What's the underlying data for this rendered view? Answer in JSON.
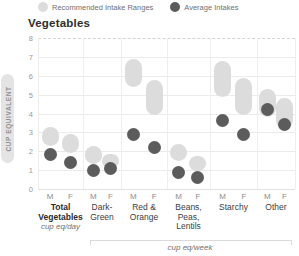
{
  "chart_data": {
    "type": "scatter",
    "title": "Vegetables",
    "ylabel": "CUP EQUIVALENT",
    "ylim": [
      0,
      8
    ],
    "yticks": [
      0,
      1,
      2,
      3,
      4,
      5,
      6,
      7,
      8
    ],
    "grid": true,
    "legend_position": "top",
    "legend": [
      {
        "label": "Recommended Intake Ranges",
        "color": "#dcdcdc",
        "style": "range"
      },
      {
        "label": "Average Intakes",
        "color": "#5c5c5c",
        "style": "dot"
      }
    ],
    "sexes": [
      "M",
      "F"
    ],
    "series_note": "Each group shows a recommended intake range (light pill) and average intake (dark dot) for M and F",
    "groups": [
      {
        "label_lines": [
          "Total",
          "Vegetables"
        ],
        "bold": true,
        "unit": "cup eq/day",
        "M": {
          "range": [
            2.3,
            3.3
          ],
          "avg": 1.85
        },
        "F": {
          "range": [
            1.9,
            2.9
          ],
          "avg": 1.4
        }
      },
      {
        "label_lines": [
          "Dark-",
          "Green"
        ],
        "bold": false,
        "M": {
          "range": [
            1.3,
            2.3
          ],
          "avg": 1.0
        },
        "F": {
          "range": [
            1.1,
            1.85
          ],
          "avg": 1.1
        }
      },
      {
        "label_lines": [
          "Red &",
          "Orange"
        ],
        "bold": false,
        "M": {
          "range": [
            5.4,
            6.9
          ],
          "avg": 2.9
        },
        "F": {
          "range": [
            3.9,
            5.8
          ],
          "avg": 2.2
        }
      },
      {
        "label_lines": [
          "Beans,",
          "Peas,",
          "Lentils"
        ],
        "bold": false,
        "M": {
          "range": [
            1.5,
            2.4
          ],
          "avg": 0.9
        },
        "F": {
          "range": [
            0.95,
            1.75
          ],
          "avg": 0.6
        }
      },
      {
        "label_lines": [
          "Starchy"
        ],
        "bold": false,
        "M": {
          "range": [
            4.9,
            6.8
          ],
          "avg": 3.65
        },
        "F": {
          "range": [
            3.9,
            5.9
          ],
          "avg": 2.9
        }
      },
      {
        "label_lines": [
          "Other"
        ],
        "bold": false,
        "M": {
          "range": [
            3.8,
            5.3
          ],
          "avg": 4.2
        },
        "F": {
          "range": [
            3.2,
            4.8
          ],
          "avg": 3.4
        }
      }
    ],
    "week_unit_label": "cup eq/week",
    "colors": {
      "range_pill": "#dcdcdc",
      "average_dot": "#5c5c5c",
      "gridline": "#ebebeb",
      "title_text": "#2e2e2e",
      "axis_text": "#9a9a9a"
    }
  }
}
